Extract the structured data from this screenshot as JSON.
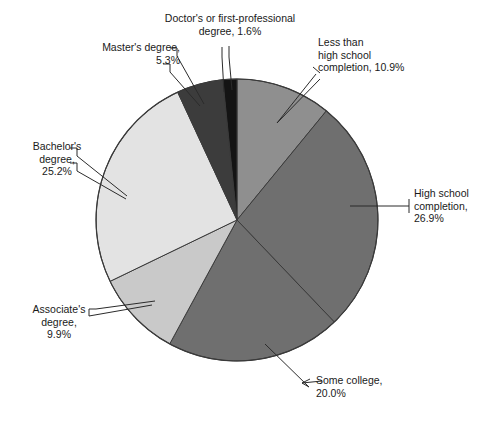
{
  "chart_data": {
    "type": "pie",
    "title": "",
    "subtitle": "",
    "xlabel": "",
    "ylabel": "",
    "legend_position": "none",
    "grid": false,
    "units": "percent",
    "start_angle_deg": 0,
    "direction": "clockwise",
    "categories": [
      "Less than high school completion",
      "High school completion",
      "Some college",
      "Associate's degree",
      "Bachelor's degree",
      "Master's degree",
      "Doctor's or first-professional degree"
    ],
    "values": [
      10.9,
      26.9,
      20.0,
      9.9,
      25.2,
      5.3,
      1.6
    ],
    "slice_colors": [
      "#8f8f8f",
      "#6f6f6f",
      "#6f6f6f",
      "#c9c9c9",
      "#e3e3e3",
      "#3c3c3c",
      "#141414"
    ],
    "slices": [
      {
        "label": "Less than high school completion",
        "value": 10.9,
        "color": "#8f8f8f"
      },
      {
        "label": "High school completion",
        "value": 26.9,
        "color": "#6f6f6f"
      },
      {
        "label": "Some college",
        "value": 20.0,
        "color": "#6f6f6f"
      },
      {
        "label": "Associate's degree",
        "value": 9.9,
        "color": "#c9c9c9"
      },
      {
        "label": "Bachelor's degree",
        "value": 25.2,
        "color": "#e3e3e3"
      },
      {
        "label": "Master's degree",
        "value": 5.3,
        "color": "#3c3c3c"
      },
      {
        "label": "Doctor's or first-professional degree",
        "value": 1.6,
        "color": "#141414"
      }
    ]
  },
  "labels": {
    "doctor": "Doctor's or first-professional\ndegree, 1.6%",
    "less_than_high_school": "Less than\nhigh school\ncompletion, 10.9%",
    "high_school": "High school\ncompletion,\n26.9%",
    "some_college": "Some college,\n20.0%",
    "associate": "Associate's\ndegree,\n9.9%",
    "bachelor": "Bachelor's\ndegree,\n25.2%",
    "master": "Master's degree,\n5.3%"
  },
  "colors": {
    "background": "#ffffff",
    "text": "#1a1a1a",
    "outline": "#3a3a3a",
    "leader_line": "#2b2b2b"
  }
}
